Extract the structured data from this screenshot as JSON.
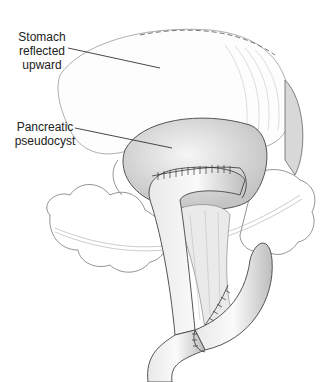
{
  "figure": {
    "labels": [
      {
        "id": "stomach",
        "lines": [
          "Stomach",
          "reflected",
          "upward"
        ]
      },
      {
        "id": "pseudocyst",
        "lines": [
          "Pancreatic",
          "pseudocyst"
        ]
      }
    ]
  },
  "colors": {
    "line": "#555555",
    "shade": "#cfcfcf",
    "background": "#ffffff"
  }
}
